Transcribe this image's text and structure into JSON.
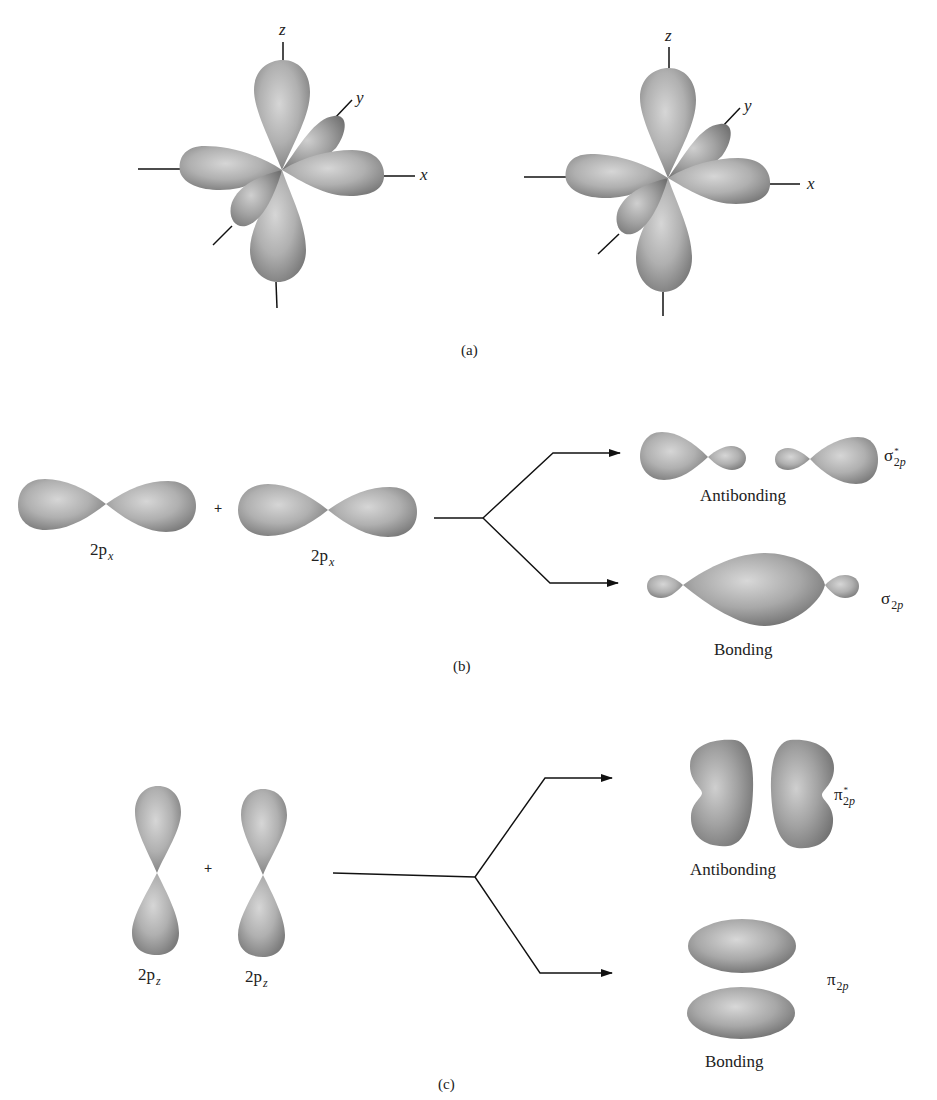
{
  "figure": {
    "panel_a": {
      "label": "(a)",
      "axes_left": {
        "z": "z",
        "y": "y",
        "x": "x"
      },
      "axes_right": {
        "z": "z",
        "y": "y",
        "x": "x"
      }
    },
    "panel_b": {
      "label": "(b)",
      "atomic_orbital_1": {
        "main": "2p",
        "sub": "x"
      },
      "plus": "+",
      "atomic_orbital_2": {
        "main": "2p",
        "sub": "x"
      },
      "antibonding": {
        "label": "Antibonding",
        "symbol": "σ",
        "star": "*",
        "sub_num": "2",
        "sub_letter": "p"
      },
      "bonding": {
        "label": "Bonding",
        "symbol": "σ",
        "sub_num": "2",
        "sub_letter": "p"
      }
    },
    "panel_c": {
      "label": "(c)",
      "atomic_orbital_1": {
        "main": "2p",
        "sub": "z"
      },
      "plus": "+",
      "atomic_orbital_2": {
        "main": "2p",
        "sub": "z"
      },
      "antibonding": {
        "label": "Antibonding",
        "symbol": "π",
        "star": "*",
        "sub_num": "2",
        "sub_letter": "p"
      },
      "bonding": {
        "label": "Bonding",
        "symbol": "π",
        "sub_num": "2",
        "sub_letter": "p"
      }
    },
    "colors": {
      "orbital_light": "#d4d4d4",
      "orbital_mid": "#a8a8a8",
      "orbital_dark": "#7a7a7a",
      "line": "#111111",
      "background": "#ffffff"
    }
  }
}
